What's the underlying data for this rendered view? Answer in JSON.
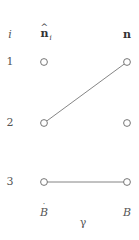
{
  "header": {
    "index_label": "i",
    "left_column_label": "n",
    "left_column_hat": "^",
    "left_column_subscript": "i",
    "right_column_label": "n"
  },
  "rows": [
    {
      "index": "1",
      "y": 62
    },
    {
      "index": "2",
      "y": 123
    },
    {
      "index": "3",
      "y": 182
    }
  ],
  "columns": {
    "left_x": 44,
    "right_x": 127,
    "index_x": 10
  },
  "edges": [
    {
      "from_row": 2,
      "from_col": "left",
      "to_row": 1,
      "to_col": "right"
    },
    {
      "from_row": 3,
      "from_col": "left",
      "to_row": 3,
      "to_col": "right"
    }
  ],
  "footer": {
    "left_label": "B",
    "left_dot": "˙",
    "right_label": "B",
    "center_label": "γ"
  },
  "colors": {
    "stroke": "#777777",
    "node_fill": "#ffffff",
    "text": "#555555"
  }
}
